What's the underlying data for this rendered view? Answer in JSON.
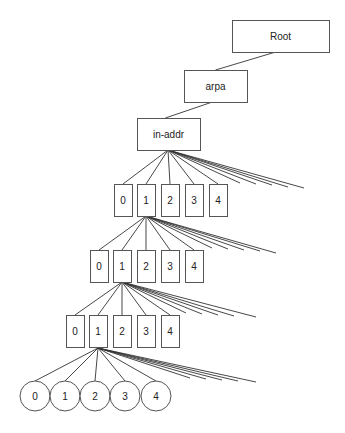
{
  "diagram": {
    "title": "",
    "type": "tree",
    "nodes": {
      "root": {
        "label": "Root",
        "x": 232,
        "y": 20,
        "w": 97,
        "h": 32
      },
      "arpa": {
        "label": "arpa",
        "x": 184,
        "y": 70,
        "w": 63,
        "h": 32
      },
      "inaddr": {
        "label": "in-addr",
        "x": 137,
        "y": 118,
        "w": 63,
        "h": 32
      }
    },
    "levels": [
      {
        "shape": "rect",
        "labels": [
          "0",
          "1",
          "2",
          "3",
          "4"
        ],
        "xs": [
          114,
          137,
          161,
          185,
          209
        ],
        "y": 184,
        "w": 18,
        "h": 32,
        "parent": {
          "x": 168,
          "y": 150
        },
        "extra_edge_ends": [
          [
            240,
            183
          ],
          [
            256,
            184
          ],
          [
            272,
            185
          ],
          [
            288,
            187
          ],
          [
            304,
            188
          ]
        ]
      },
      {
        "shape": "rect",
        "labels": [
          "0",
          "1",
          "2",
          "3",
          "4"
        ],
        "xs": [
          90,
          113,
          137,
          161,
          185
        ],
        "y": 250,
        "w": 18,
        "h": 32,
        "parent": {
          "x": 146,
          "y": 216
        },
        "extra_edge_ends": [
          [
            212,
            248
          ],
          [
            228,
            249
          ],
          [
            244,
            250
          ],
          [
            260,
            251
          ],
          [
            276,
            253
          ]
        ]
      },
      {
        "shape": "rect",
        "labels": [
          "0",
          "1",
          "2",
          "3",
          "4"
        ],
        "xs": [
          66,
          89,
          113,
          137,
          161
        ],
        "y": 315,
        "w": 18,
        "h": 32,
        "parent": {
          "x": 122,
          "y": 282
        },
        "extra_edge_ends": [
          [
            186,
            313
          ],
          [
            202,
            314
          ],
          [
            218,
            315
          ],
          [
            234,
            316
          ],
          [
            256,
            317
          ]
        ]
      },
      {
        "shape": "circle",
        "labels": [
          "0",
          "1",
          "2",
          "3",
          "4"
        ],
        "xs": [
          35,
          65,
          95,
          125,
          156
        ],
        "y": 396,
        "r": 15,
        "parent": {
          "x": 98,
          "y": 348
        },
        "extra_edge_ends": [
          [
            190,
            378
          ],
          [
            206,
            379
          ],
          [
            222,
            380
          ],
          [
            238,
            381
          ],
          [
            256,
            382
          ]
        ]
      }
    ]
  }
}
